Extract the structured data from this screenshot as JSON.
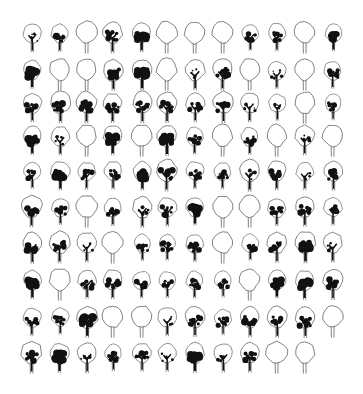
{
  "sheet": {
    "title": "Tree elevation symbols",
    "background": "#ffffff",
    "ink": "#111111",
    "outline": "#555555",
    "columns_x": [
      32,
      60,
      87,
      113,
      142,
      167,
      195,
      223,
      250,
      277,
      305,
      333
    ],
    "rows_y": [
      38,
      75,
      108,
      141,
      176,
      212,
      248,
      285,
      322,
      358
    ],
    "legend": {
      "e": "outline only",
      "s": "sparse foliage",
      "m": "medium foliage",
      "d": "dense foliage"
    },
    "rows": [
      [
        "s",
        "m",
        "e",
        "m",
        "d",
        "e",
        "e",
        "e",
        "m",
        "m",
        "e",
        "d"
      ],
      [
        "d",
        "e",
        "e",
        "m",
        "d",
        "e",
        "s",
        "m",
        "e",
        "s",
        "e",
        "m"
      ],
      [
        "m",
        "m",
        "m",
        "m",
        "m",
        "m",
        "m",
        "m",
        "s",
        "s",
        "e",
        "m"
      ],
      [
        "d",
        "s",
        "e",
        "d",
        "e",
        "d",
        "m",
        "e",
        "m",
        "e",
        "s",
        "e"
      ],
      [
        "m",
        "d",
        "m",
        "m",
        "d",
        "m",
        "m",
        "m",
        "s",
        "m",
        "s",
        "m"
      ],
      [
        "m",
        "m",
        "e",
        "m",
        "s",
        "m",
        "d",
        "e",
        "e",
        "m",
        "m",
        "m"
      ],
      [
        "m",
        "m",
        "s",
        "e",
        "m",
        "m",
        "m",
        "e",
        "m",
        "m",
        "d",
        "s"
      ],
      [
        "d",
        "e",
        "m",
        "m",
        "m",
        "m",
        "m",
        "m",
        "e",
        "d",
        "d",
        "m"
      ],
      [
        "m",
        "m",
        "d",
        "e",
        "e",
        "s",
        "m",
        "m",
        "m",
        "m",
        "m",
        "e"
      ],
      [
        "m",
        "d",
        "s",
        "m",
        "m",
        "s",
        "d",
        "s",
        "m",
        "e",
        "e"
      ]
    ]
  }
}
